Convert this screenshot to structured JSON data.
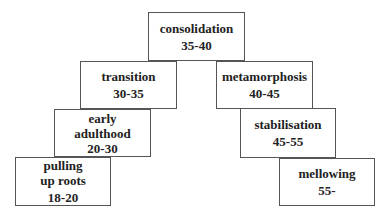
{
  "diagram": {
    "type": "stepped-pyramid",
    "stages": [
      {
        "id": "pulling-up-roots",
        "label": "pulling\nup roots",
        "range": "18-20",
        "box": {
          "x": 15,
          "y": 157,
          "w": 96,
          "h": 49
        }
      },
      {
        "id": "early-adulthood",
        "label": "early\nadulthood",
        "range": "20-30",
        "box": {
          "x": 54,
          "y": 109,
          "w": 97,
          "h": 48
        }
      },
      {
        "id": "transition",
        "label": "transition",
        "range": "30-35",
        "box": {
          "x": 80,
          "y": 61,
          "w": 97,
          "h": 48
        }
      },
      {
        "id": "consolidation",
        "label": "consolidation",
        "range": "35-40",
        "box": {
          "x": 148,
          "y": 12,
          "w": 97,
          "h": 49
        }
      },
      {
        "id": "metamorphosis",
        "label": "metamorphosis",
        "range": "40-45",
        "box": {
          "x": 216,
          "y": 61,
          "w": 97,
          "h": 48
        }
      },
      {
        "id": "stabilisation",
        "label": "stabilisation",
        "range": "45-55",
        "box": {
          "x": 240,
          "y": 108,
          "w": 96,
          "h": 50
        }
      },
      {
        "id": "mellowing",
        "label": "mellowing",
        "range": "55-",
        "box": {
          "x": 279,
          "y": 158,
          "w": 96,
          "h": 48
        }
      }
    ],
    "colors": {
      "border": "#555555",
      "text": "#222222",
      "background": "#ffffff"
    }
  }
}
